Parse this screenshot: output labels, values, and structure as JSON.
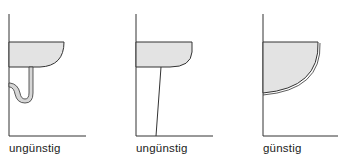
{
  "panels": [
    {
      "id": "wall-basin-with-trap",
      "label": "ungünstig",
      "rating": "unfavorable"
    },
    {
      "id": "basin-with-pedestal",
      "label": "ungünstig",
      "rating": "unfavorable"
    },
    {
      "id": "wall-hung-deep-basin",
      "label": "günstig",
      "rating": "favorable"
    }
  ],
  "colors": {
    "line": "#333333",
    "basin_fill": "#e3e3e3",
    "pipe_fill": "#d6d6d6",
    "text": "#222222"
  }
}
